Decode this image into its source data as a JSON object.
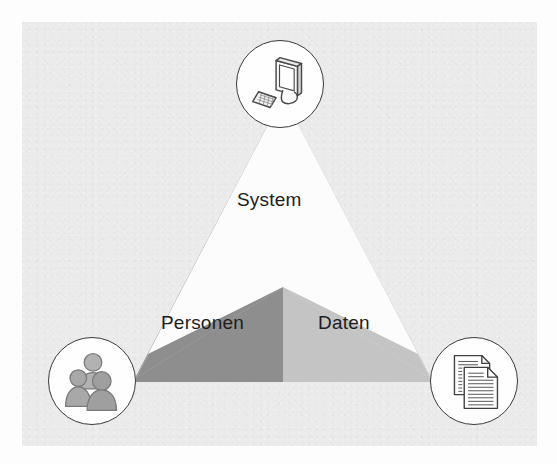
{
  "diagram": {
    "type": "triangle-venn",
    "background_color": "#ebebeb",
    "wedges": [
      {
        "id": "system",
        "label": "System",
        "position": "top",
        "fill_color": "#ffffff",
        "icon": "computer-monitor-keyboard-icon"
      },
      {
        "id": "personen",
        "label": "Personen",
        "position": "bottom-left",
        "fill_color": "#8e8e8e",
        "icon": "group-of-people-icon"
      },
      {
        "id": "daten",
        "label": "Daten",
        "position": "bottom-right",
        "fill_color": "#c4c4c4",
        "icon": "stacked-documents-icon"
      }
    ],
    "nodes": [
      {
        "id": "node-system",
        "icon": "computer-monitor-keyboard-icon",
        "outline_color": "#3a3a3a",
        "fill_color": "#fefefe"
      },
      {
        "id": "node-people",
        "icon": "group-of-people-icon",
        "outline_color": "#3a3a3a",
        "fill_color": "#fefefe"
      },
      {
        "id": "node-data",
        "icon": "stacked-documents-icon",
        "outline_color": "#3a3a3a",
        "fill_color": "#fefefe"
      }
    ]
  }
}
